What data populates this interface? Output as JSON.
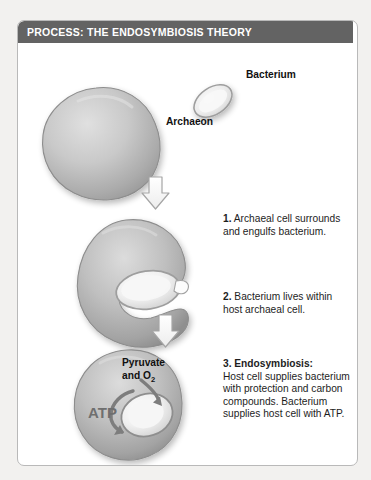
{
  "figure": {
    "title": "PROCESS: THE ENDOSYMBIOSIS THEORY",
    "title_bar_color": "#636363",
    "frame_border_color": "#b9b9b9",
    "background_color": "#f2f1ef",
    "panel_color": "#ffffff"
  },
  "labels": {
    "bacterium": "Bacterium",
    "archaeon": "Archaeon",
    "pyruvate_line1": "Pyruvate",
    "pyruvate_line2": "and O",
    "pyruvate_subscript": "2",
    "atp": "ATP"
  },
  "steps": [
    {
      "number": "1.",
      "lead": "1.",
      "text": "Archaeal cell surrounds and engulfs bacterium.",
      "line1": "1. Archaeal cell",
      "line2": "surrounds and",
      "line3": "engulfs bacterium."
    },
    {
      "number": "2.",
      "lead": "2.",
      "text": "Bacterium lives within host archaeal cell.",
      "line1": "2. Bacterium lives",
      "line2": "within host archaeal cell."
    },
    {
      "number": "3.",
      "lead": "3. Endosymbiosis:",
      "text": "Host cell supplies bacterium with protection and carbon compounds. Bacterium supplies host cell with ATP.",
      "line1": "3. Endosymbiosis:",
      "line2": "Host cell supplies",
      "line3": "bacterium with protection",
      "line4": "and carbon compounds.",
      "line5": "Bacterium supplies",
      "line6": "host cell with ATP."
    }
  ],
  "diagram": {
    "cell_fill_light": "#d3d3d3",
    "cell_fill_dark": "#9b9b9b",
    "cell_outline": "#8a8a8a",
    "bacterium_fill": "#efefef",
    "arrow_outline": "#9a9a9a",
    "arrow_fill": "#fbfbfb",
    "cycle_arrow_color": "#7d7d7d",
    "stages": [
      {
        "name": "free-archaeon",
        "shape": "large-round-cell"
      },
      {
        "name": "free-bacterium",
        "shape": "tilted-ellipse"
      },
      {
        "name": "engulfing-cell",
        "shape": "c-shaped-cell-with-bacterium"
      },
      {
        "name": "endosymbiont-cell",
        "shape": "round-cell-with-internal-bacterium"
      },
      {
        "name": "mitochondrion-cell",
        "shape": "round-cell-with-exchange-arrows"
      }
    ],
    "flow_arrows": 3
  }
}
